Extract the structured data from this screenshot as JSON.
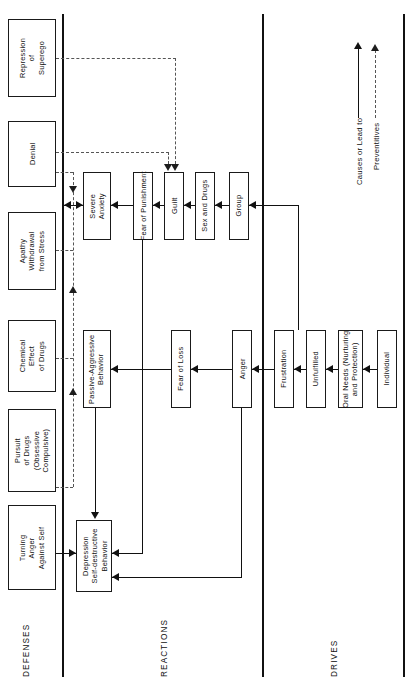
{
  "diagram": {
    "orientation": "rotated-90",
    "sections": [
      {
        "id": "defenses",
        "label": "DEFENSES"
      },
      {
        "id": "reactions",
        "label": "REACTIONS"
      },
      {
        "id": "drives",
        "label": "DRIVES"
      }
    ],
    "legend": {
      "solid_label": "Causes or Lead to",
      "dashed_label": "Preventitives"
    },
    "nodes": {
      "defenses": [
        {
          "id": "repression-of-superego",
          "text": "Repression\nof\nSuperego"
        },
        {
          "id": "denial",
          "text": "Denial"
        },
        {
          "id": "apathy-withdrawal",
          "text": "Apathy\nWithdrawal\nfrom Stress"
        },
        {
          "id": "chemical-effect",
          "text": "Chemical\nEffect\nof Drugs"
        },
        {
          "id": "pursuit-of-drugs",
          "text": "Pursuit\nof Drugs\n(Obsessive\nCompulsive)"
        },
        {
          "id": "turning-anger",
          "text": "Turning\nAnger\nAgainst Self"
        }
      ],
      "reactions": [
        {
          "id": "severe-anxiety",
          "text": "Severe\nAnxiety"
        },
        {
          "id": "fear-of-punishment",
          "text": "Fear of Punishment"
        },
        {
          "id": "guilt",
          "text": "Guilt"
        },
        {
          "id": "sex-and-drugs",
          "text": "Sex and Drugs"
        },
        {
          "id": "group",
          "text": "Group"
        },
        {
          "id": "passive-aggressive",
          "text": "Passive-Aggressive\nBehavior"
        },
        {
          "id": "fear-of-loss",
          "text": "Fear of Loss"
        },
        {
          "id": "anger",
          "text": "Anger"
        },
        {
          "id": "depression",
          "text": "Depression\nSelf-destructive\nBehavior"
        }
      ],
      "drives": [
        {
          "id": "frustration",
          "text": "Frustration"
        },
        {
          "id": "unfulfilled",
          "text": "Unfulfilled"
        },
        {
          "id": "oral-needs",
          "text": "Oral Needs (Nurturing\nand Protection)"
        },
        {
          "id": "individual",
          "text": "Individual"
        }
      ]
    },
    "colors": {
      "ink": "#111111",
      "dashed": "#555555",
      "background": "#ffffff"
    }
  }
}
